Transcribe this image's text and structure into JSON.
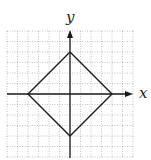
{
  "chart_data": {
    "type": "line",
    "title": "",
    "xlabel": "x",
    "ylabel": "y",
    "xlim": [
      -6,
      6
    ],
    "ylim": [
      -6,
      6
    ],
    "grid": true,
    "grid_style": "dotted",
    "series": [
      {
        "name": "diamond",
        "x": [
          0,
          4,
          0,
          -4,
          0
        ],
        "y": [
          4,
          0,
          -4,
          0,
          4
        ]
      }
    ],
    "legend": null
  },
  "axes": {
    "x_label": "x",
    "y_label": "y"
  },
  "colors": {
    "grid": "#9a9a9a",
    "axis": "#1a1a1a",
    "curve": "#1a1a1a"
  }
}
